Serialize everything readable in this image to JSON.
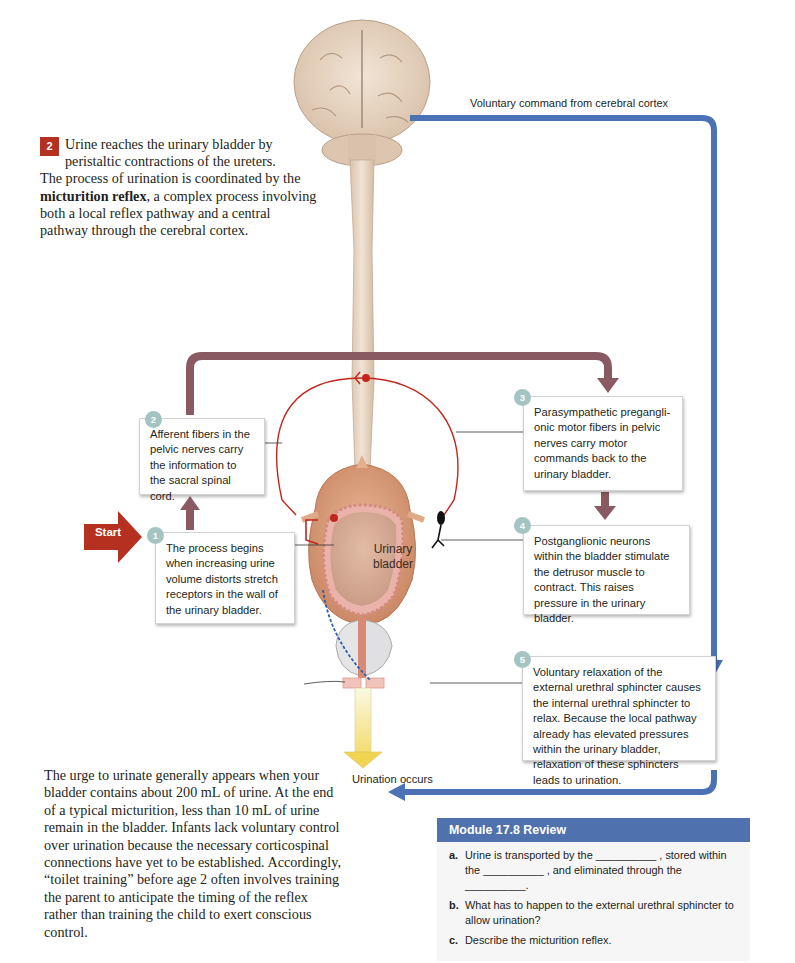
{
  "intro": {
    "badge": "2",
    "line1": "Urine reaches the urinary bladder by",
    "line2": "peristaltic contractions of the ureters.",
    "rest_before": "The process of urination is coordinated by the ",
    "bold_term": "micturition reflex",
    "rest_after": ", a complex process involving both a local reflex pathway and a central pathway through the cerebral cortex."
  },
  "diagram": {
    "voluntary_command_label": "Voluntary command from cerebral cortex",
    "start_label": "Start",
    "bladder_label_line1": "Urinary",
    "bladder_label_line2": "bladder",
    "urination_label": "Urination occurs",
    "steps": [
      {
        "num": "1",
        "text": "The process begins when increasing urine volume distorts stretch receptors in the wall of the urinary bladder."
      },
      {
        "num": "2",
        "text": "Afferent fibers in the pelvic nerves carry the information to the sacral spinal cord."
      },
      {
        "num": "3",
        "text": "Parasympathetic pregangli-onic motor fibers in pelvic nerves carry motor commands back to the urinary bladder."
      },
      {
        "num": "4",
        "text": "Postganglionic neurons within the bladder stimulate the detrusor muscle to contract. This raises pressure in the urinary bladder."
      },
      {
        "num": "5",
        "text": "Voluntary relaxation of the external urethral sphincter causes the internal urethral sphincter to relax. Because the local pathway already has elevated pressures within the urinary bladder, relaxation of these sphincters leads to urination."
      }
    ],
    "colors": {
      "local_pathway_arrow": "#8a5a62",
      "voluntary_pathway_arrow": "#4a72b5",
      "start_arrow": "#b5301f",
      "step_badge": "#a4c4c1",
      "reflex_nerve": "#c2271e"
    }
  },
  "body_paragraph": "The urge to urinate generally appears when your bladder contains about 200 mL of urine. At the end of a typical micturition, less than 10 mL of urine remain in the bladder. Infants lack voluntary control over urination because the necessary corticospinal connections have yet to be established. Accordingly, “toilet training” before age 2 often involves training the parent to anticipate the timing of the reflex rather than training the child to exert conscious control.",
  "review": {
    "title": "Module 17.8 Review",
    "header_color": "#4f72ae",
    "items": [
      {
        "letter": "a.",
        "text": "Urine is transported by the __________ , stored within the __________ , and eliminated through the __________."
      },
      {
        "letter": "b.",
        "text": "What has to happen to the external urethral sphincter to allow urination?"
      },
      {
        "letter": "c.",
        "text": "Describe the micturition reflex."
      }
    ]
  }
}
